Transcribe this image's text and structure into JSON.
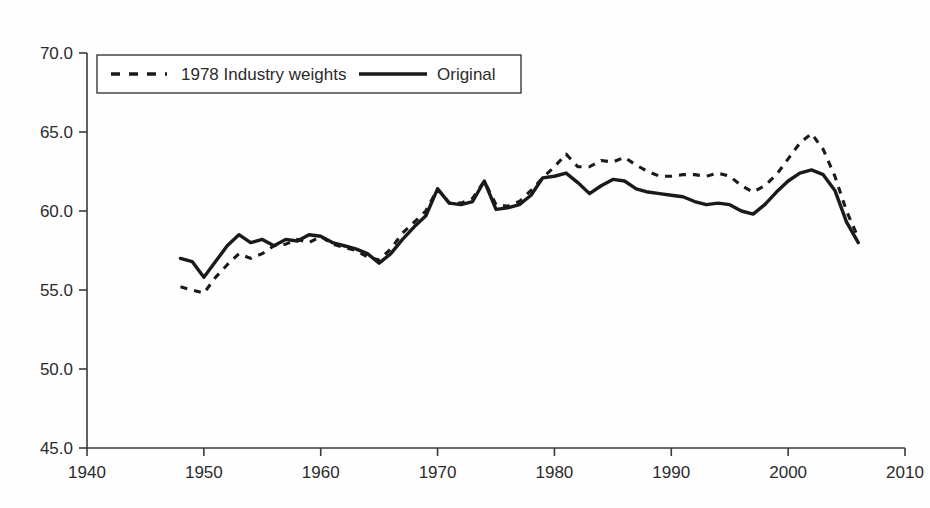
{
  "chart_data": {
    "type": "line",
    "title": "",
    "subtitle": "",
    "xlabel": "",
    "ylabel": "",
    "xlim": [
      1940,
      2010
    ],
    "ylim": [
      45.0,
      70.0
    ],
    "grid": false,
    "legend_position": "top-left",
    "x_ticks": [
      "1940",
      "1950",
      "1960",
      "1970",
      "1980",
      "1990",
      "2000",
      "2010"
    ],
    "x_tick_values": [
      1940,
      1950,
      1960,
      1970,
      1980,
      1990,
      2000,
      2010
    ],
    "y_ticks": [
      "45.0",
      "50.0",
      "55.0",
      "60.0",
      "65.0",
      "70.0"
    ],
    "y_tick_values": [
      45.0,
      50.0,
      55.0,
      60.0,
      65.0,
      70.0
    ],
    "x": [
      1948,
      1949,
      1950,
      1951,
      1952,
      1953,
      1954,
      1955,
      1956,
      1957,
      1958,
      1959,
      1960,
      1961,
      1962,
      1963,
      1964,
      1965,
      1966,
      1967,
      1968,
      1969,
      1970,
      1971,
      1972,
      1973,
      1974,
      1975,
      1976,
      1977,
      1978,
      1979,
      1980,
      1981,
      1982,
      1983,
      1984,
      1985,
      1986,
      1987,
      1988,
      1989,
      1990,
      1991,
      1992,
      1993,
      1994,
      1995,
      1996,
      1997,
      1998,
      1999,
      2000,
      2001,
      2002,
      2003,
      2004,
      2005,
      2006
    ],
    "series": [
      {
        "name": "1978 Industry weights",
        "style": "dashed",
        "color": "#1a1a1a",
        "values": [
          55.2,
          55.0,
          54.8,
          55.8,
          56.6,
          57.3,
          57.0,
          57.3,
          57.8,
          57.9,
          58.2,
          58.0,
          58.4,
          57.9,
          57.7,
          57.5,
          57.1,
          56.9,
          57.6,
          58.6,
          59.3,
          60.0,
          61.4,
          60.5,
          60.5,
          60.8,
          61.9,
          60.4,
          60.3,
          60.6,
          61.3,
          62.1,
          62.8,
          63.6,
          62.8,
          62.8,
          63.2,
          63.1,
          63.4,
          62.9,
          62.5,
          62.2,
          62.2,
          62.3,
          62.3,
          62.2,
          62.4,
          62.2,
          61.6,
          61.2,
          61.6,
          62.3,
          63.3,
          64.3,
          64.9,
          63.9,
          62.2,
          60.0,
          58.3
        ]
      },
      {
        "name": "Original",
        "style": "solid",
        "color": "#1a1a1a",
        "values": [
          57.0,
          56.8,
          55.8,
          56.8,
          57.8,
          58.5,
          58.0,
          58.2,
          57.8,
          58.2,
          58.1,
          58.5,
          58.4,
          58.0,
          57.8,
          57.6,
          57.3,
          56.7,
          57.3,
          58.2,
          59.0,
          59.7,
          61.4,
          60.5,
          60.4,
          60.6,
          61.9,
          60.1,
          60.2,
          60.4,
          61.0,
          62.1,
          62.2,
          62.4,
          61.8,
          61.1,
          61.6,
          62.0,
          61.9,
          61.4,
          61.2,
          61.1,
          61.0,
          60.9,
          60.6,
          60.4,
          60.5,
          60.4,
          60.0,
          59.8,
          60.4,
          61.2,
          61.9,
          62.4,
          62.6,
          62.3,
          61.3,
          59.3,
          58.0
        ]
      }
    ],
    "legend": [
      {
        "label": "1978 Industry weights",
        "style": "dashed"
      },
      {
        "label": "Original",
        "style": "solid"
      }
    ]
  }
}
